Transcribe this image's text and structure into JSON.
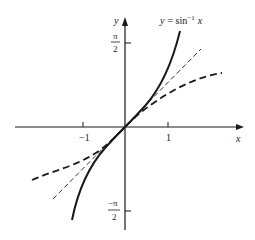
{
  "figure": {
    "curve_label": "y = sin⁻¹ x",
    "curve_label_parts": {
      "lhs": "y",
      "eq": "= sin",
      "sup": "−1",
      "rhs": "x"
    },
    "x_axis_label": "x",
    "y_axis_label": "y",
    "x_ticks": [
      {
        "value": -1,
        "label": "−1"
      },
      {
        "value": 1,
        "label": "1"
      }
    ],
    "y_ticks": [
      {
        "value": 1.5708,
        "label_num": "π",
        "label_den": "2"
      },
      {
        "value": -1.5708,
        "label_num": "−π",
        "label_den": "2"
      }
    ],
    "curves": [
      {
        "name": "arcsin",
        "style": "solid-thick"
      },
      {
        "name": "tangent-line",
        "style": "dashed-thin"
      },
      {
        "name": "approximation",
        "style": "dashed-thick"
      }
    ],
    "colors": {
      "ink": "#1a1a1a",
      "background": "#ffffff"
    }
  }
}
